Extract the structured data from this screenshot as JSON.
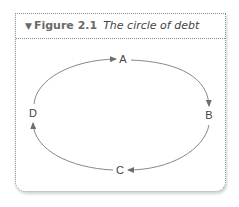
{
  "figure": {
    "collapse_icon": "triangle-down-icon",
    "number": "Figure 2.1",
    "title": "The circle of debt"
  },
  "diagram": {
    "type": "cycle",
    "nodes": [
      {
        "id": "A",
        "label": "A"
      },
      {
        "id": "B",
        "label": "B"
      },
      {
        "id": "C",
        "label": "C"
      },
      {
        "id": "D",
        "label": "D"
      }
    ],
    "edges": [
      {
        "from": "A",
        "to": "B"
      },
      {
        "from": "B",
        "to": "C"
      },
      {
        "from": "C",
        "to": "D"
      },
      {
        "from": "D",
        "to": "A"
      }
    ],
    "colors": {
      "line": "#6e6e6e",
      "text": "#444444",
      "border": "#8a8a8a"
    }
  }
}
